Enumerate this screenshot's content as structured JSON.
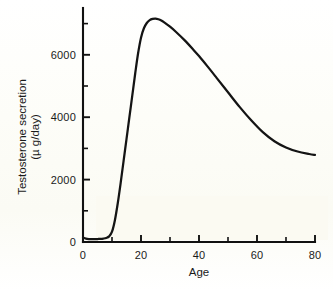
{
  "chart_data": {
    "type": "line",
    "title": "",
    "xlabel": "Age",
    "ylabel_line1": "Testosterone secretion",
    "ylabel_line2": "(µ g/day)",
    "xlim": [
      0,
      80
    ],
    "ylim": [
      0,
      7500
    ],
    "grid": false,
    "legend": "none",
    "x_ticks": [
      0,
      20,
      40,
      60,
      80
    ],
    "x_tick_labels": [
      "0",
      "20",
      "40",
      "60",
      "80"
    ],
    "x_minor_ticks": [
      10,
      30,
      50,
      70
    ],
    "y_ticks": [
      0,
      2000,
      4000,
      6000
    ],
    "y_tick_labels": [
      "0",
      "2000",
      "4000",
      "6000"
    ],
    "y_minor_ticks": [
      1000,
      3000,
      5000,
      7000
    ],
    "series": [
      {
        "name": "Testosterone secretion",
        "color": "#141414",
        "x": [
          0,
          1,
          2,
          3,
          4,
          5,
          6,
          7,
          8,
          9,
          10,
          11,
          12,
          13,
          14,
          15,
          16,
          17,
          18,
          19,
          20,
          21,
          22,
          23,
          24,
          25,
          26,
          27,
          28,
          30,
          32,
          35,
          38,
          40,
          43,
          46,
          50,
          54,
          58,
          62,
          66,
          70,
          74,
          78,
          80
        ],
        "y": [
          140,
          110,
          95,
          90,
          90,
          95,
          100,
          110,
          130,
          180,
          330,
          700,
          1250,
          1900,
          2600,
          3300,
          4000,
          4700,
          5400,
          6050,
          6550,
          6850,
          7020,
          7110,
          7150,
          7160,
          7140,
          7100,
          7040,
          6900,
          6740,
          6470,
          6170,
          5960,
          5620,
          5270,
          4800,
          4330,
          3900,
          3520,
          3230,
          3030,
          2900,
          2820,
          2790
        ]
      }
    ],
    "peak": {
      "age": 25,
      "value": 7160
    },
    "endpoint": {
      "age": 80,
      "value": 2790
    }
  },
  "axis_geometry": {
    "origin_x": 83,
    "origin_y": 242,
    "x_end": 315,
    "y_top": 8
  }
}
